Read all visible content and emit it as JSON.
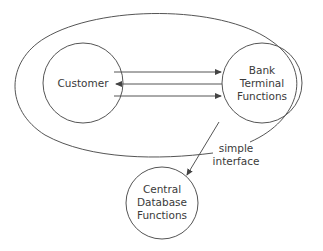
{
  "diagram": {
    "nodes": [
      {
        "id": "customer",
        "label": "Customer",
        "lines": [
          "Customer"
        ]
      },
      {
        "id": "bank_terminal",
        "label": "Bank Terminal Functions",
        "lines": [
          "Bank",
          "Terminal",
          "Functions"
        ]
      },
      {
        "id": "central_db",
        "label": "Central Database Functions",
        "lines": [
          "Central",
          "Database",
          "Functions"
        ]
      }
    ],
    "edges": [
      {
        "from": "customer",
        "to": "bank_terminal"
      },
      {
        "from": "bank_terminal",
        "to": "customer"
      },
      {
        "from": "customer",
        "to": "bank_terminal"
      },
      {
        "from": "bank_terminal",
        "to": "central_db"
      }
    ],
    "boundary": {
      "label_lines": [
        "simple",
        "interface"
      ],
      "label": "simple interface"
    },
    "colors": {
      "stroke": "#555555",
      "text": "#3a3a3a",
      "background": "#ffffff"
    }
  }
}
